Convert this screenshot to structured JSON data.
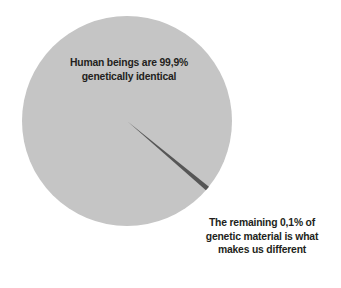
{
  "figure": {
    "background_color": "#ffffff",
    "title": ""
  },
  "pie": {
    "center_x": 127,
    "center_y": 121,
    "radius": 105,
    "major_slice_color": "#c5c5c5",
    "minor_slice_color": "#565656",
    "outline_color": "#c5c5c5"
  },
  "labels": {
    "major": {
      "name": "identical-label",
      "line1": "Human beings are 99,9%",
      "line2": "genetically identical",
      "text_color": "#231f20"
    },
    "minor": {
      "name": "different-label",
      "line1": "The remaining 0,1% of",
      "line2": "genetic material is what",
      "line3": "makes us different",
      "text_color": "#231f20"
    }
  },
  "chart_data": {
    "type": "pie",
    "title": "",
    "categories": [
      "Genetically identical",
      "Genetic material that makes us different"
    ],
    "values": [
      99.9,
      0.1
    ],
    "value_labels": [
      "99,9%",
      "0,1%"
    ],
    "colors": [
      "#c5c5c5",
      "#565656"
    ],
    "unit": "%",
    "total": 100,
    "start_angle_deg": 40,
    "direction": "clockwise",
    "legend": "none",
    "grid": false,
    "annotations": [
      "Human beings are 99,9% genetically identical",
      "The remaining 0,1% of genetic material is what makes us different"
    ]
  }
}
